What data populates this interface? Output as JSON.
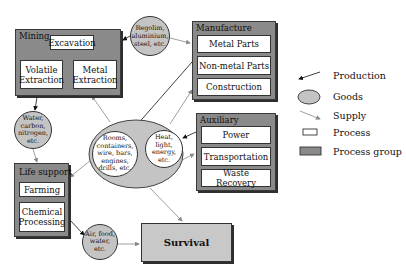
{
  "groups": {
    "mining": {
      "title": "Mining",
      "processes": [
        "Excavation",
        "Volatile Extraction",
        "Metal Extraction"
      ]
    },
    "manufacture": {
      "title": "Manufacture",
      "processes": [
        "Metal Parts",
        "Non-metal Parts",
        "Construction"
      ]
    },
    "auxiliary": {
      "title": "Auxiliary",
      "processes": [
        "Power",
        "Transportation",
        "Waste Recovery"
      ]
    },
    "life_support": {
      "title": "Life support",
      "processes": [
        "Farming",
        "Chemical Processing"
      ]
    }
  },
  "goods": {
    "regolith": "Regolim, aluminium, steel, etc.",
    "water": "Water, carbon, nitrogen, etc.",
    "rooms": "Rooms, containers, wire, bars, engines, drills, etc.",
    "heat": "Heat, light, energy, etc.",
    "air": "Air, food, water, etc."
  },
  "survival": {
    "label": "Survival"
  },
  "legend": {
    "items": [
      {
        "label": "Production",
        "icon": "production-arrow-icon"
      },
      {
        "label": "Goods",
        "icon": "goods-ellipse-icon"
      },
      {
        "label": "Supply",
        "icon": "supply-arrow-icon"
      },
      {
        "label": "Process",
        "icon": "process-box-icon"
      },
      {
        "label": "Process group",
        "icon": "process-group-box-icon"
      }
    ]
  },
  "colors": {
    "process_group_fill": "#8a8a8a",
    "goods_fill": "#c4c4c4",
    "survival_fill": "#c8c8c8",
    "production_arrow": "#111111",
    "supply_arrow": "#888888"
  }
}
